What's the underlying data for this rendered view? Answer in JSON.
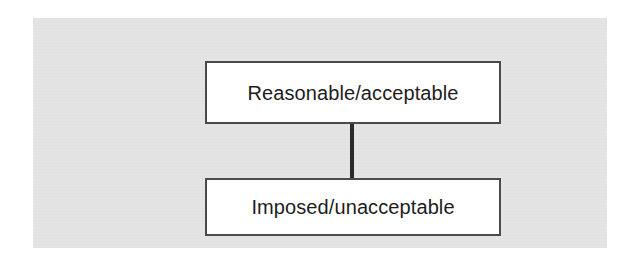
{
  "figure": {
    "background_color": "#e4e4e4",
    "box_fill_color": "#ffffff",
    "box_border_color": "#4b4b4b",
    "connector_color": "#2b2b2b",
    "text_color": "#1d1d1d",
    "nodes": [
      {
        "id": "reasonable",
        "label": "Reasonable/acceptable"
      },
      {
        "id": "imposed",
        "label": "Imposed/unacceptable"
      }
    ],
    "connectors": [
      {
        "from": "reasonable",
        "to": "imposed",
        "style": "vertical-line"
      }
    ]
  }
}
